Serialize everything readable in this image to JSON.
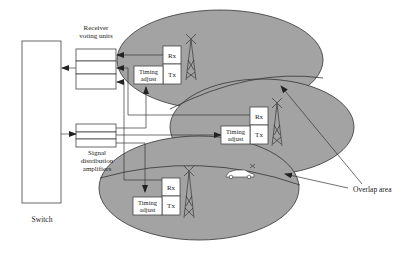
{
  "diagram": {
    "labels": {
      "receiver_voting_units_1": "Receiver",
      "receiver_voting_units_2": "voting units",
      "switch": "Switch",
      "signal_distribution_1": "Signal",
      "signal_distribution_2": "distribution",
      "signal_distribution_3": "amplifiers",
      "overlap_area": "Overlap area"
    },
    "cells": [
      {
        "name": "cell-top",
        "rx": "Rx",
        "tx": "Tx",
        "timing": [
          "Timing",
          "adjust"
        ]
      },
      {
        "name": "cell-middle",
        "rx": "Rx",
        "tx": "Tx",
        "timing": [
          "Timing",
          "adjust"
        ]
      },
      {
        "name": "cell-bottom",
        "rx": "Rx",
        "tx": "Tx",
        "timing": [
          "Timing",
          "adjust"
        ]
      }
    ],
    "colors": {
      "cell_fill": "#a3a3a3",
      "stroke": "#333333",
      "box_fill": "#ffffff"
    }
  }
}
